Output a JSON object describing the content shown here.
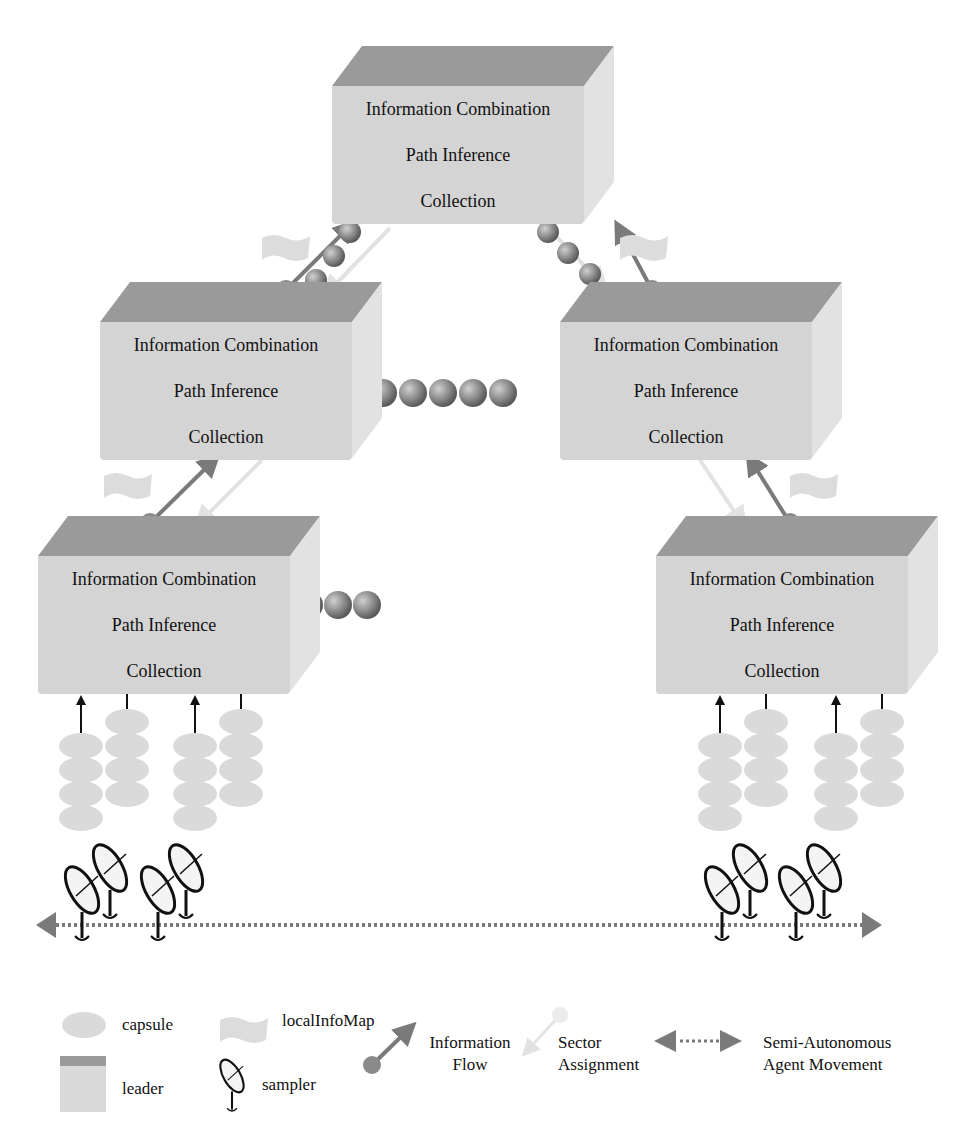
{
  "diagram": {
    "layers": [
      "Information Combination",
      "Path Inference",
      "Collection"
    ],
    "leaders": [
      {
        "id": "top",
        "x": 332,
        "y": 46,
        "w": 250
      },
      {
        "id": "mid-left",
        "x": 100,
        "y": 282,
        "w": 250
      },
      {
        "id": "mid-right",
        "x": 560,
        "y": 282,
        "w": 250
      },
      {
        "id": "bottom-left",
        "x": 38,
        "y": 516,
        "w": 250
      },
      {
        "id": "bottom-right",
        "x": 656,
        "y": 516,
        "w": 250
      }
    ],
    "capsule_queues": [
      {
        "near": "mid-left",
        "count": 5
      },
      {
        "near": "bottom-left",
        "count": 3
      },
      {
        "near": "top-left-link",
        "count": 3
      },
      {
        "near": "top-right-link",
        "count": 3
      }
    ],
    "colors": {
      "leader_face": "#d4d4d4",
      "leader_top": "#9a9a9a",
      "arrow": "#7a7a7a",
      "sector_arrow": "#e4e4e4",
      "capsule": "#d8d8d8",
      "ball": "#8a8a8a"
    }
  },
  "legend": {
    "capsule": "capsule",
    "localInfoMap": "localInfoMap",
    "leader": "leader",
    "sampler": "sampler",
    "info_flow_1": "Information",
    "info_flow_2": "Flow",
    "sector_1": "Sector",
    "sector_2": "Assignment",
    "movement_1": "Semi-Autonomous",
    "movement_2": "Agent Movement"
  }
}
